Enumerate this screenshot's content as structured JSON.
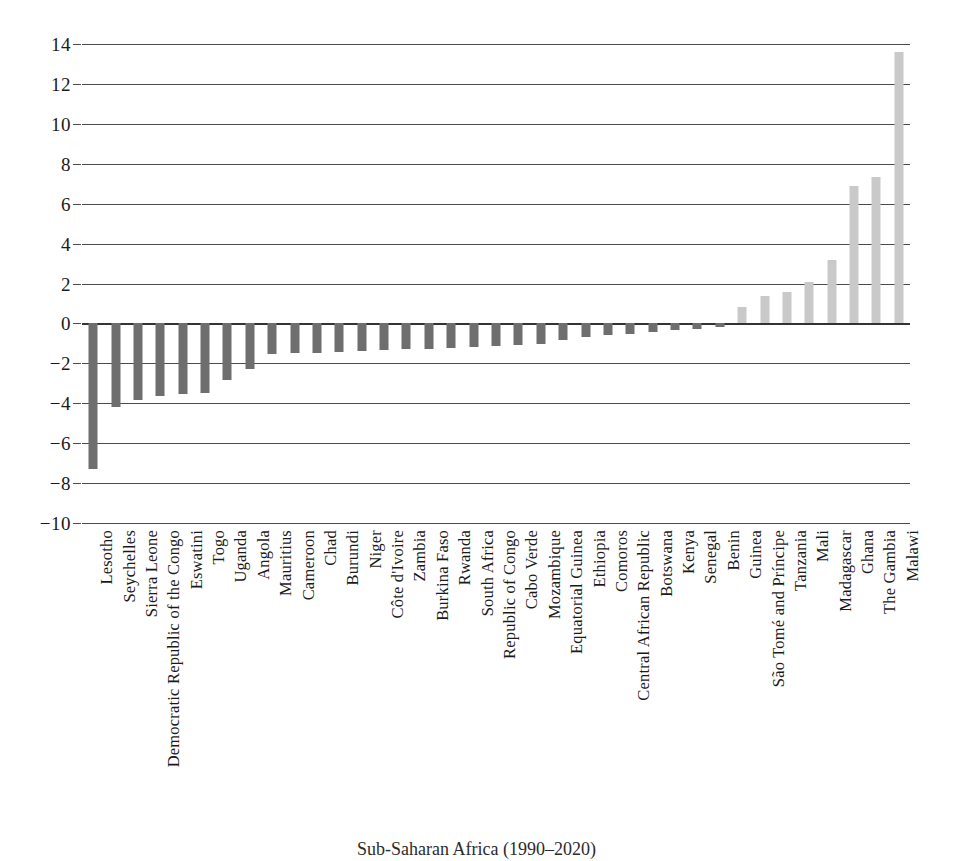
{
  "chart_data": {
    "type": "bar",
    "title": "",
    "subtitle": "",
    "xlabel": "",
    "ylabel": "",
    "ylim": [
      -10,
      14
    ],
    "yticks": [
      14,
      12,
      10,
      8,
      6,
      4,
      2,
      0,
      -2,
      -4,
      -6,
      -8,
      -10
    ],
    "ytick_labels": [
      "14",
      "12",
      "10",
      "8",
      "6",
      "4",
      "2",
      "0",
      "−2",
      "−4",
      "−6",
      "−8",
      "−10"
    ],
    "grid": true,
    "legend": "none",
    "zero_line": 0,
    "colors": {
      "negative_bar": "#6e6e6e",
      "positive_bar": "#c9c9c9",
      "gridline": "#4c4c4c",
      "text": "#1a1a1a"
    },
    "categories": [
      "Lesotho",
      "Seychelles",
      "Sierra Leone",
      "Democratic Republic of the Congo",
      "Eswatini",
      "Togo",
      "Uganda",
      "Angola",
      "Mauritius",
      "Cameroon",
      "Chad",
      "Burundi",
      "Niger",
      "Côte d'Ivoire",
      "Zambia",
      "Burkina Faso",
      "Rwanda",
      "South Africa",
      "Republic of Congo",
      "Cabo Verde",
      "Mozambique",
      "Equatorial Guinea",
      "Ethiopia",
      "Comoros",
      "Central African Republic",
      "Botswana",
      "Kenya",
      "Senegal",
      "Benin",
      "Guinea",
      "São Tomé and Príncipe",
      "Tanzania",
      "Mali",
      "Madagascar",
      "Ghana",
      "The Gambia",
      "Malawi"
    ],
    "values": [
      -7.3,
      -4.2,
      -3.85,
      -3.65,
      -3.55,
      -3.5,
      -2.85,
      -2.3,
      -1.55,
      -1.5,
      -1.5,
      -1.45,
      -1.4,
      -1.35,
      -1.3,
      -1.3,
      -1.25,
      -1.2,
      -1.15,
      -1.1,
      -1.05,
      -0.85,
      -0.7,
      -0.6,
      -0.55,
      -0.45,
      -0.35,
      -0.3,
      -0.2,
      0.8,
      1.35,
      1.55,
      2.1,
      3.2,
      6.9,
      7.35,
      13.6
    ]
  },
  "caption": {
    "text": "Sub-Saharan Africa (1990–2020)"
  }
}
